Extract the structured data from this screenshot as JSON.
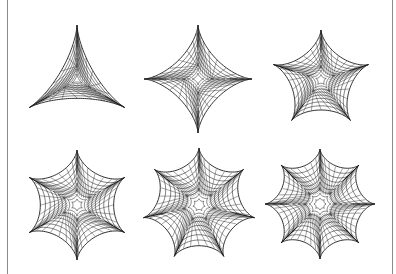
{
  "figure": {
    "border": {
      "left_x": 7,
      "right_x": 393,
      "color": "#8c8c8c"
    },
    "ink_color": "#1a1a1a",
    "shapes": [
      {
        "name": "deltoid",
        "cusps": 3,
        "cx": 77,
        "cy": 80,
        "r": 55,
        "rotation_deg": -90
      },
      {
        "name": "astroid",
        "cusps": 4,
        "cx": 198,
        "cy": 79,
        "r": 54,
        "rotation_deg": -90
      },
      {
        "name": "five-cusp-star",
        "cusps": 5,
        "cx": 321,
        "cy": 80,
        "r": 50,
        "rotation_deg": -90
      },
      {
        "name": "six-cusp-star",
        "cusps": 6,
        "cx": 77,
        "cy": 205,
        "r": 55,
        "rotation_deg": -90
      },
      {
        "name": "seven-cusp-star",
        "cusps": 7,
        "cx": 199,
        "cy": 205,
        "r": 57,
        "rotation_deg": -90
      },
      {
        "name": "eight-cusp-star",
        "cusps": 8,
        "cx": 320,
        "cy": 204,
        "r": 55,
        "rotation_deg": -90
      }
    ]
  }
}
